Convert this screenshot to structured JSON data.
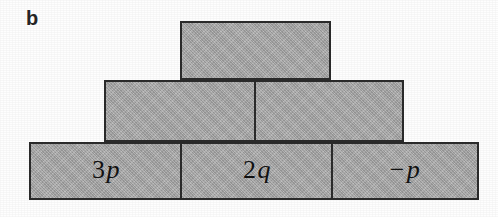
{
  "figure": {
    "panel_label": "b",
    "type": "algebra-pyramid",
    "background_color": "#ffffff",
    "brick_fill_color": "#a9a9a9",
    "brick_border_color": "#2b2b2b",
    "text_color": "#121212"
  },
  "rows": {
    "top": {
      "count": 1,
      "bricks": [
        {
          "label": "",
          "op": "",
          "num": "",
          "var": "",
          "x": 180,
          "width": 151
        }
      ]
    },
    "middle": {
      "count": 2,
      "bricks": [
        {
          "label": "",
          "op": "",
          "num": "",
          "var": "",
          "x": 104,
          "width": 152
        },
        {
          "label": "",
          "op": "",
          "num": "",
          "var": "",
          "x": 254,
          "width": 150
        }
      ]
    },
    "bottom": {
      "count": 3,
      "bricks": [
        {
          "label": "3p",
          "op": "",
          "num": "3",
          "var": "p",
          "x": 29,
          "width": 153
        },
        {
          "label": "2q",
          "op": "",
          "num": "2",
          "var": "q",
          "x": 180,
          "width": 153
        },
        {
          "label": "-p",
          "op": "−",
          "num": "",
          "var": "p",
          "x": 331,
          "width": 148
        }
      ]
    }
  }
}
